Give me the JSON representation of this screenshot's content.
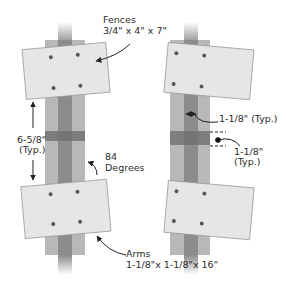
{
  "figure": {
    "type": "technical-diagram"
  },
  "labels": {
    "fences_title": "Fences",
    "fences_dims": "3/4\" x 4\" x 7\"",
    "spacing_value": "6-5/8\"",
    "spacing_note": "(Typ.)",
    "angle_value": "84",
    "angle_unit": "Degrees",
    "arms_title": "Arms",
    "arms_dims": "1-1/8\"x 1-1/8\"x 16\"",
    "arm_width": "1-1/8\" (Typ.)",
    "band_width_value": "1-1/8\"",
    "band_width_note": "(Typ.)"
  },
  "colors": {
    "fence_fill": "#e6e6e6",
    "fence_stroke": "#9a9a9a",
    "outer_post": "#b8b8b8",
    "inner_arm": "#8c8c8c",
    "band": "#6f6f6f",
    "screw": "#555555",
    "text": "#2b2b2b"
  }
}
